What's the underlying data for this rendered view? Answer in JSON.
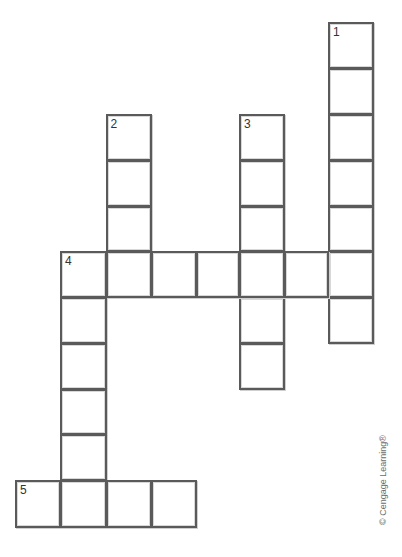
{
  "puzzle": {
    "type": "crossword",
    "cell_size_px": 45.5,
    "origin_px": {
      "x": 15,
      "y": 22
    },
    "entries": [
      {
        "number": 1,
        "direction": "down",
        "row": 0,
        "col": 7,
        "length": 7
      },
      {
        "number": 2,
        "direction": "down",
        "row": 2,
        "col": 2,
        "length": 3
      },
      {
        "number": 3,
        "direction": "down",
        "row": 2,
        "col": 5,
        "length": 6
      },
      {
        "number": 4,
        "direction": "across",
        "row": 5,
        "col": 1,
        "length": 7
      },
      {
        "number": 4,
        "direction": "down",
        "row": 5,
        "col": 1,
        "length": 6
      },
      {
        "number": 5,
        "direction": "across",
        "row": 10,
        "col": 0,
        "length": 4
      }
    ],
    "cells": [
      {
        "row": 0,
        "col": 7,
        "label": "1"
      },
      {
        "row": 1,
        "col": 7,
        "label": ""
      },
      {
        "row": 2,
        "col": 7,
        "label": ""
      },
      {
        "row": 3,
        "col": 7,
        "label": ""
      },
      {
        "row": 4,
        "col": 7,
        "label": ""
      },
      {
        "row": 5,
        "col": 7,
        "label": ""
      },
      {
        "row": 6,
        "col": 7,
        "label": ""
      },
      {
        "row": 2,
        "col": 2,
        "label": "2"
      },
      {
        "row": 3,
        "col": 2,
        "label": ""
      },
      {
        "row": 4,
        "col": 2,
        "label": ""
      },
      {
        "row": 2,
        "col": 5,
        "label": "3"
      },
      {
        "row": 3,
        "col": 5,
        "label": ""
      },
      {
        "row": 4,
        "col": 5,
        "label": ""
      },
      {
        "row": 6,
        "col": 5,
        "label": ""
      },
      {
        "row": 7,
        "col": 5,
        "label": ""
      },
      {
        "row": 5,
        "col": 1,
        "label": "4"
      },
      {
        "row": 5,
        "col": 2,
        "label": ""
      },
      {
        "row": 5,
        "col": 3,
        "label": ""
      },
      {
        "row": 5,
        "col": 4,
        "label": ""
      },
      {
        "row": 5,
        "col": 5,
        "label": ""
      },
      {
        "row": 5,
        "col": 6,
        "label": ""
      },
      {
        "row": 6,
        "col": 1,
        "label": ""
      },
      {
        "row": 7,
        "col": 1,
        "label": ""
      },
      {
        "row": 8,
        "col": 1,
        "label": ""
      },
      {
        "row": 9,
        "col": 1,
        "label": ""
      },
      {
        "row": 10,
        "col": 0,
        "label": "5"
      },
      {
        "row": 10,
        "col": 1,
        "label": ""
      },
      {
        "row": 10,
        "col": 2,
        "label": ""
      },
      {
        "row": 10,
        "col": 3,
        "label": ""
      }
    ]
  },
  "credit": "© Cengage Learning®"
}
